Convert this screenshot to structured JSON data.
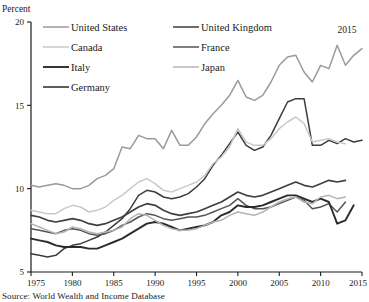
{
  "chart_data": {
    "type": "line",
    "title": "",
    "ylabel": "Percent",
    "xlabel": "",
    "ylim": [
      5,
      20
    ],
    "xlim": [
      1975,
      2015
    ],
    "yticks": [
      5,
      10,
      15,
      20
    ],
    "xticks": [
      1975,
      1980,
      1985,
      1990,
      1995,
      2000,
      2005,
      2010,
      2015
    ],
    "grid": false,
    "legend_position": "top-left",
    "annotations": [
      {
        "text": "2015",
        "x": 2013.2,
        "y": 19.35
      }
    ],
    "source": "Source: World Wealth and Income Database",
    "x": [
      1975,
      1976,
      1977,
      1978,
      1979,
      1980,
      1981,
      1982,
      1983,
      1984,
      1985,
      1986,
      1987,
      1988,
      1989,
      1990,
      1991,
      1992,
      1993,
      1994,
      1995,
      1996,
      1997,
      1998,
      1999,
      2000,
      2001,
      2002,
      2003,
      2004,
      2005,
      2006,
      2007,
      2008,
      2009,
      2010,
      2011,
      2012,
      2013,
      2014,
      2015
    ],
    "series": [
      {
        "name": "United States",
        "color": "#9a9a9a",
        "width": 1.5,
        "values": [
          10.2,
          10.1,
          10.2,
          10.3,
          10.2,
          10.0,
          10.0,
          10.2,
          10.6,
          10.8,
          11.2,
          12.5,
          12.4,
          13.2,
          13.0,
          13.0,
          12.4,
          13.5,
          12.6,
          12.6,
          13.1,
          13.9,
          14.5,
          15.0,
          15.6,
          16.5,
          15.5,
          15.3,
          15.6,
          16.4,
          17.4,
          17.9,
          18.0,
          17.0,
          16.4,
          17.4,
          17.2,
          18.6,
          17.4,
          18.0,
          18.4
        ]
      },
      {
        "name": "United Kingdom",
        "color": "#3c3c3c",
        "width": 1.5,
        "values": [
          6.1,
          6.0,
          5.9,
          6.0,
          6.4,
          6.6,
          6.7,
          6.9,
          7.1,
          7.4,
          7.8,
          8.2,
          8.8,
          9.6,
          9.9,
          9.8,
          9.5,
          9.4,
          9.5,
          9.7,
          10.1,
          10.6,
          11.4,
          12.0,
          12.7,
          13.4,
          12.6,
          12.3,
          12.5,
          13.2,
          14.2,
          15.2,
          15.4,
          15.4,
          12.6,
          12.6,
          12.9,
          12.7,
          13.0,
          12.8,
          12.9
        ]
      },
      {
        "name": "Canada",
        "color": "#c9c9c9",
        "width": 1.5,
        "values": [
          8.7,
          8.6,
          8.5,
          8.5,
          8.8,
          9.0,
          8.9,
          8.6,
          8.7,
          8.9,
          9.3,
          9.6,
          10.0,
          10.4,
          10.6,
          10.3,
          9.9,
          9.8,
          10.0,
          10.2,
          10.4,
          10.8,
          11.5,
          11.9,
          12.5,
          13.6,
          12.8,
          12.6,
          12.6,
          13.0,
          13.6,
          14.0,
          14.3,
          13.9,
          12.8,
          12.9,
          13.0,
          12.8,
          12.7,
          null,
          null
        ]
      },
      {
        "name": "France",
        "color": "#555555",
        "width": 1.5,
        "values": [
          7.6,
          7.5,
          7.4,
          7.3,
          7.5,
          7.6,
          7.5,
          7.3,
          7.2,
          7.3,
          7.5,
          7.8,
          8.0,
          8.3,
          8.5,
          8.4,
          8.2,
          8.1,
          8.2,
          8.3,
          8.3,
          8.4,
          8.6,
          8.8,
          9.0,
          9.4,
          9.0,
          8.8,
          8.8,
          8.9,
          9.1,
          9.3,
          9.5,
          9.3,
          8.8,
          8.9,
          9.1,
          8.6,
          9.2,
          null,
          null
        ]
      },
      {
        "name": "Italy",
        "color": "#2b2b2b",
        "width": 1.9,
        "values": [
          7.0,
          6.9,
          6.8,
          6.6,
          6.5,
          6.5,
          6.5,
          6.4,
          6.4,
          6.6,
          6.8,
          7.0,
          7.3,
          7.6,
          7.9,
          8.0,
          7.9,
          7.7,
          7.5,
          7.6,
          7.7,
          7.8,
          8.0,
          8.4,
          8.6,
          9.0,
          8.9,
          8.9,
          9.0,
          9.2,
          9.4,
          9.6,
          9.6,
          9.4,
          9.2,
          9.4,
          9.2,
          7.9,
          8.1,
          9.0,
          null
        ]
      },
      {
        "name": "Japan",
        "color": "#b4b4b4",
        "width": 1.5,
        "values": [
          7.9,
          7.7,
          7.5,
          7.3,
          7.4,
          7.7,
          7.6,
          7.4,
          7.3,
          7.4,
          7.5,
          7.7,
          8.2,
          8.5,
          8.4,
          8.1,
          7.8,
          7.6,
          7.5,
          7.5,
          7.6,
          7.8,
          8.0,
          8.1,
          8.4,
          8.6,
          8.5,
          8.4,
          8.6,
          8.9,
          9.2,
          9.4,
          9.5,
          9.2,
          9.1,
          9.5,
          9.6,
          9.4,
          9.5,
          null,
          null
        ]
      },
      {
        "name": "Germany",
        "color": "#404040",
        "width": 1.7,
        "values": [
          8.4,
          8.3,
          8.1,
          8.0,
          8.1,
          8.2,
          8.1,
          7.9,
          7.8,
          7.9,
          8.1,
          8.3,
          8.6,
          8.9,
          9.1,
          9.0,
          8.7,
          8.5,
          8.4,
          8.5,
          8.6,
          8.8,
          9.0,
          9.2,
          9.5,
          9.8,
          9.6,
          9.5,
          9.6,
          9.8,
          10.0,
          10.2,
          10.4,
          10.2,
          10.1,
          10.3,
          10.5,
          10.4,
          10.5,
          null,
          null
        ]
      }
    ],
    "legend": [
      {
        "label": "United States",
        "color": "#9a9a9a",
        "col": 0,
        "row": 0,
        "width": 1.5
      },
      {
        "label": "United Kingdom",
        "color": "#3c3c3c",
        "col": 1,
        "row": 0,
        "width": 1.5
      },
      {
        "label": "Canada",
        "color": "#c9c9c9",
        "col": 0,
        "row": 1,
        "width": 1.5
      },
      {
        "label": "France",
        "color": "#555555",
        "col": 1,
        "row": 1,
        "width": 1.5
      },
      {
        "label": "Italy",
        "color": "#2b2b2b",
        "col": 0,
        "row": 2,
        "width": 1.9
      },
      {
        "label": "Japan",
        "color": "#b4b4b4",
        "col": 1,
        "row": 2,
        "width": 1.5
      },
      {
        "label": "Germany",
        "color": "#404040",
        "col": 0,
        "row": 3,
        "width": 1.7
      }
    ]
  }
}
